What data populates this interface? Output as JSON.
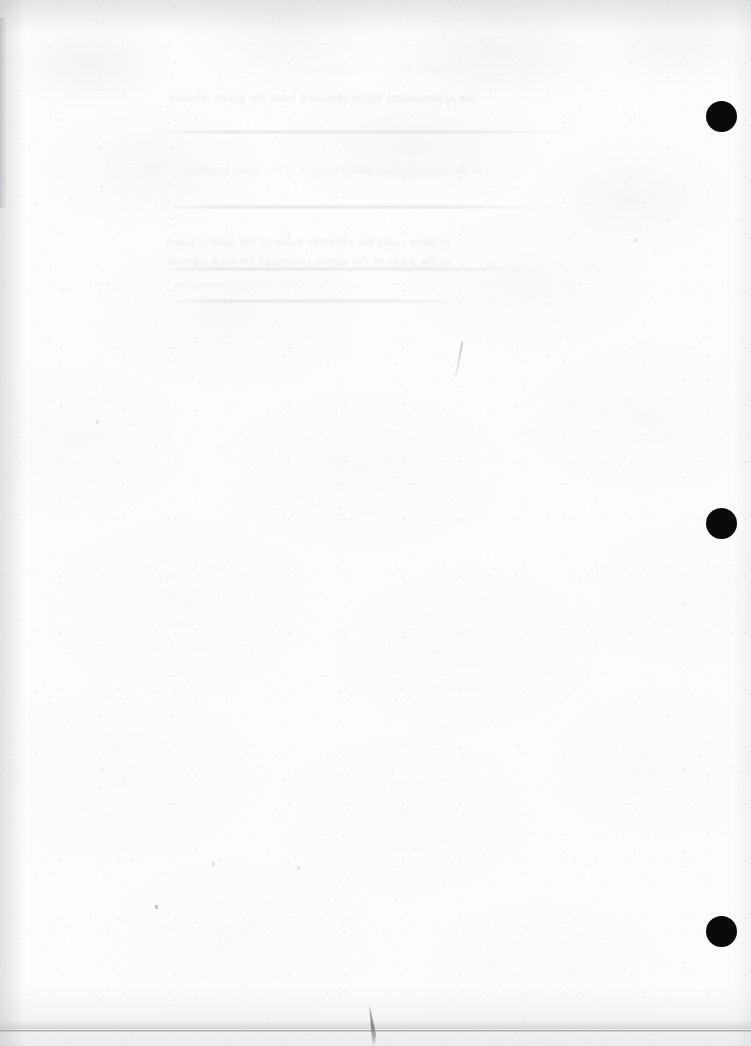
{
  "page": {
    "kind": "scanned-document-page",
    "appearance": "blank verso with mirrored show-through text",
    "width": 751,
    "height": 1046,
    "paper_color": "#fdfdfd",
    "ink_color": "#0a0a0a",
    "bleed_text_color": "#707a82",
    "edge_shadow_color": "#a8abb0",
    "visible_text": ""
  },
  "marks": {
    "registration_dots": [
      {
        "label": "",
        "cx": 722,
        "cy": 117,
        "d": 31
      },
      {
        "label": "",
        "cx": 722,
        "cy": 524,
        "d": 31
      },
      {
        "label": "",
        "cx": 722,
        "cy": 932,
        "d": 31
      }
    ],
    "page_edge_rule": {
      "y": 1030
    },
    "hair_artifact": {
      "x": 368,
      "y": 1002
    },
    "stray_diagonal": {
      "x": 458,
      "y": 342
    },
    "specks": [
      {
        "x": 155,
        "y": 905
      },
      {
        "x": 212,
        "y": 862
      },
      {
        "x": 297,
        "y": 866
      },
      {
        "x": 634,
        "y": 238
      },
      {
        "x": 96,
        "y": 420
      }
    ]
  },
  "bleed_through": {
    "note": "Faint mirrored text showing through from the reverse side; individual words are not legible at scan resolution.",
    "blocks": [
      {
        "x": 168,
        "y": 88,
        "size": 13.5,
        "opacity": "normal",
        "lines": [
          "the approximate value obtained from the given relation"
        ]
      },
      {
        "x": 186,
        "y": 160,
        "size": 13,
        "opacity": "faint",
        "lines": [
          "in the case of a thin uniform layer of the same material"
        ]
      },
      {
        "x": 166,
        "y": 232,
        "size": 13,
        "opacity": "normal",
        "lines": [
          "in these cases the effective value of the ratio is taken",
          "as the mean of the values computed for each interval"
        ]
      },
      {
        "x": 300,
        "y": 60,
        "size": 11,
        "opacity": "vfaint",
        "lines": [
          "continued from the preceding page"
        ]
      },
      {
        "x": 176,
        "y": 276,
        "size": 11,
        "opacity": "vfaint",
        "lines": [
          "which reduces to the simple expression"
        ]
      }
    ],
    "ghost_rules": [
      {
        "x": 150,
        "y": 131,
        "w": 430
      },
      {
        "x": 158,
        "y": 206,
        "w": 400
      },
      {
        "x": 150,
        "y": 268,
        "w": 380
      },
      {
        "x": 170,
        "y": 300,
        "w": 300
      }
    ]
  }
}
